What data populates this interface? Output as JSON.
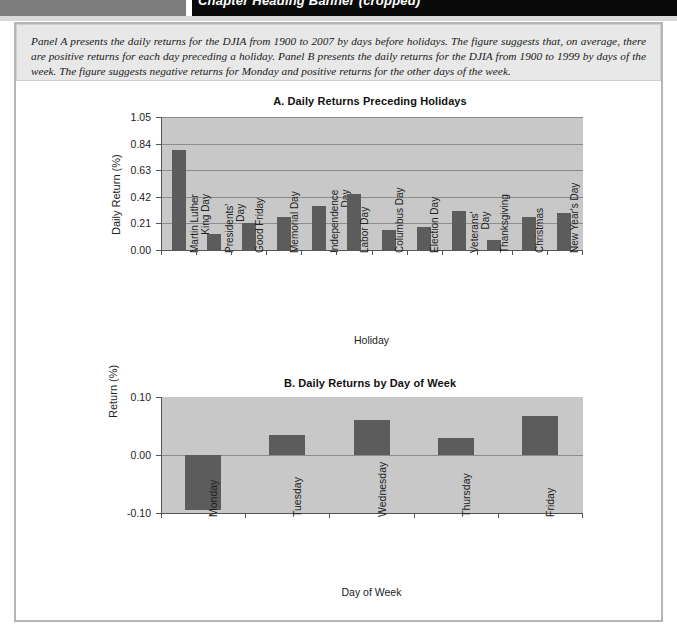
{
  "banner": {
    "left_block": "",
    "right_text": "Chapter Heading Banner (cropped)"
  },
  "caption": {
    "text": "Panel A presents the daily returns for the DJIA from 1900 to 2007 by days before holidays. The figure suggests that, on average, there are positive returns for each day preceding a holiday. Panel B presents the daily returns for the DJIA from 1900 to 1999 by days of the week. The figure suggests negative returns for Monday and positive returns for the other days of the week."
  },
  "chart_data": [
    {
      "type": "bar",
      "panel": "A",
      "title": "A. Daily Returns Preceding Holidays",
      "xlabel": "Holiday",
      "ylabel": "Daily Return (%)",
      "ylim": [
        0.0,
        1.05
      ],
      "yticks": [
        "0.00",
        "0.21",
        "0.42",
        "0.63",
        "0.84",
        "1.05"
      ],
      "ytick_values": [
        0.0,
        0.21,
        0.42,
        0.63,
        0.84,
        1.05
      ],
      "grid": true,
      "legend": "none",
      "categories": [
        "Martin Luther King Day",
        "Presidents' Day",
        "Good Friday",
        "Memorial Day",
        "Independence Day",
        "Labor Day",
        "Columbus Day",
        "Election Day",
        "Veterans' Day",
        "Thanksgiving",
        "Christmas",
        "New Year's Day"
      ],
      "values": [
        0.79,
        0.13,
        0.21,
        0.26,
        0.35,
        0.44,
        0.16,
        0.18,
        0.31,
        0.08,
        0.26,
        0.29
      ]
    },
    {
      "type": "bar",
      "panel": "B",
      "title": "B. Daily Returns by Day of Week",
      "xlabel": "Day of Week",
      "ylabel": "Return (%)",
      "ylim": [
        -0.1,
        0.1
      ],
      "yticks": [
        "-0.10",
        "0.00",
        "0.10"
      ],
      "ytick_values": [
        -0.1,
        0.0,
        0.1
      ],
      "grid": false,
      "legend": "none",
      "categories": [
        "Monday",
        "Tuesday",
        "Wednesday",
        "Thursday",
        "Friday"
      ],
      "values": [
        -0.094,
        0.035,
        0.06,
        0.029,
        0.067
      ]
    }
  ]
}
